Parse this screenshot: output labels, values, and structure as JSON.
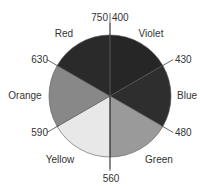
{
  "diagram": {
    "type": "color-wheel",
    "center": [
      110,
      96
    ],
    "radius": 61,
    "slices": [
      {
        "name": "Violet",
        "from_deg": 0,
        "to_deg": 60,
        "color": "#262626",
        "label_pos": [
          151,
          37
        ]
      },
      {
        "name": "Blue",
        "from_deg": 60,
        "to_deg": 120,
        "color": "#2e2e2e",
        "label_pos": [
          187,
          99
        ]
      },
      {
        "name": "Green",
        "from_deg": 120,
        "to_deg": 180,
        "color": "#9a9a9a",
        "label_pos": [
          159,
          163
        ]
      },
      {
        "name": "Yellow",
        "from_deg": 180,
        "to_deg": 240,
        "color": "#e8e8e8",
        "label_pos": [
          60,
          163
        ]
      },
      {
        "name": "Orange",
        "from_deg": 240,
        "to_deg": 300,
        "color": "#888888",
        "label_pos": [
          25,
          99
        ]
      },
      {
        "name": "Red",
        "from_deg": 300,
        "to_deg": 360,
        "color": "#2a2a2a",
        "label_pos": [
          64,
          37
        ]
      }
    ],
    "boundaries": [
      {
        "angle_deg": 0,
        "label": "750 | 400",
        "text_pos": [
          115,
          21
        ],
        "anchor": "middle"
      },
      {
        "angle_deg": 60,
        "label": "430",
        "text_pos": [
          175,
          63
        ],
        "anchor": "start"
      },
      {
        "angle_deg": 120,
        "label": "480",
        "text_pos": [
          175,
          136
        ],
        "anchor": "start"
      },
      {
        "angle_deg": 180,
        "label": "560",
        "text_pos": [
          111,
          182
        ],
        "anchor": "middle"
      },
      {
        "angle_deg": 240,
        "label": "590",
        "text_pos": [
          48,
          136
        ],
        "anchor": "end"
      },
      {
        "angle_deg": 300,
        "label": "630",
        "text_pos": [
          48,
          63
        ],
        "anchor": "end"
      }
    ]
  }
}
